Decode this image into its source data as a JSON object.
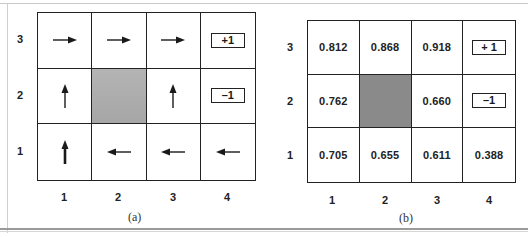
{
  "figure": {
    "panel_a": {
      "caption": "(a)",
      "row_labels": [
        "3",
        "2",
        "1"
      ],
      "col_labels": [
        "1",
        "2",
        "3",
        "4"
      ],
      "cells": [
        [
          {
            "type": "arrow",
            "dir": "right"
          },
          {
            "type": "arrow",
            "dir": "right"
          },
          {
            "type": "arrow",
            "dir": "right"
          },
          {
            "type": "reward",
            "label": "+1"
          }
        ],
        [
          {
            "type": "arrow",
            "dir": "up"
          },
          {
            "type": "wall"
          },
          {
            "type": "arrow",
            "dir": "up"
          },
          {
            "type": "reward",
            "label": "–1"
          }
        ],
        [
          {
            "type": "arrow",
            "dir": "up"
          },
          {
            "type": "arrow",
            "dir": "left"
          },
          {
            "type": "arrow",
            "dir": "left"
          },
          {
            "type": "arrow",
            "dir": "left"
          }
        ]
      ]
    },
    "panel_b": {
      "caption": "(b)",
      "row_labels": [
        "3",
        "2",
        "1"
      ],
      "col_labels": [
        "1",
        "2",
        "3",
        "4"
      ],
      "cells": [
        [
          {
            "type": "value",
            "label": "0.812"
          },
          {
            "type": "value",
            "label": "0.868"
          },
          {
            "type": "value",
            "label": "0.918"
          },
          {
            "type": "reward",
            "label": "+ 1"
          }
        ],
        [
          {
            "type": "value",
            "label": "0.762"
          },
          {
            "type": "wall"
          },
          {
            "type": "value",
            "label": "0.660"
          },
          {
            "type": "reward",
            "label": "–1"
          }
        ],
        [
          {
            "type": "value",
            "label": "0.705"
          },
          {
            "type": "value",
            "label": "0.655"
          },
          {
            "type": "value",
            "label": "0.611"
          },
          {
            "type": "value",
            "label": "0.388"
          }
        ]
      ]
    },
    "colors": {
      "grid_line": "#222222",
      "wall_a": "#aeaeae",
      "wall_b": "#8a8a8a"
    }
  }
}
